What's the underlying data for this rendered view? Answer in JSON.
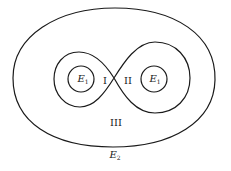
{
  "diagram": {
    "labels": {
      "inner_left": {
        "main": "E",
        "sub": "1"
      },
      "region_i": "I",
      "region_ii": "II",
      "inner_right": {
        "main": "E",
        "sub": "1"
      },
      "region_iii": "III",
      "outer": {
        "main": "E",
        "sub": "2"
      }
    },
    "stroke_color": "#1a1a1a"
  }
}
